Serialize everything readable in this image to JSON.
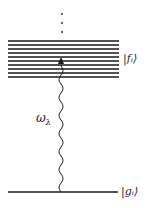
{
  "diagram": {
    "title": "",
    "colors": {
      "line": "#1a1a1a",
      "background": "#ffffff"
    },
    "upper_band": {
      "label": "|f_i⟩",
      "label_display": "|fᵢ⟩",
      "level_count": 9,
      "level_y": [
        41,
        45,
        49,
        53,
        57,
        61,
        65,
        69,
        73
      ]
    },
    "continuation_dots": {
      "count": 3,
      "symbol": "⋮"
    },
    "ground_level": {
      "label": "|g_i⟩",
      "label_display": "|gᵢ⟩",
      "y": 192
    },
    "photon": {
      "label": "ω_λ",
      "label_display": "ω",
      "label_sub": "λ",
      "type": "wavy-arrow-up"
    }
  }
}
